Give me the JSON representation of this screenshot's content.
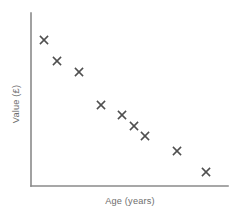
{
  "figure": {
    "width": 241,
    "height": 215,
    "background": "#ffffff"
  },
  "chart_data": {
    "type": "scatter",
    "title": "",
    "subtitle": "",
    "xlabel": "Age (years)",
    "ylabel": "Value (£)",
    "grid": false,
    "legend": null,
    "legend_position": "none",
    "xticks": [],
    "yticks": [],
    "xticklabels": [],
    "yticklabels": [],
    "xlim": [
      0,
      10
    ],
    "ylim": [
      0,
      10
    ],
    "marker": "x",
    "marker_color": "#4f4f4f",
    "axis_color": "#8a8a8a",
    "n_points": 9,
    "annotations": [],
    "points": [
      {
        "x": 1.0,
        "y": 9.0
      },
      {
        "x": 1.7,
        "y": 7.8
      },
      {
        "x": 2.8,
        "y": 7.2
      },
      {
        "x": 4.0,
        "y": 5.3
      },
      {
        "x": 5.0,
        "y": 4.7
      },
      {
        "x": 5.6,
        "y": 4.1
      },
      {
        "x": 6.2,
        "y": 3.5
      },
      {
        "x": 8.0,
        "y": 2.7
      },
      {
        "x": 9.5,
        "y": 1.5
      }
    ],
    "pixel_points": [
      {
        "cx": 44,
        "cy": 40
      },
      {
        "cx": 57,
        "cy": 61
      },
      {
        "cx": 79,
        "cy": 72
      },
      {
        "cx": 101,
        "cy": 105
      },
      {
        "cx": 122,
        "cy": 115
      },
      {
        "cx": 134,
        "cy": 126
      },
      {
        "cx": 145,
        "cy": 136
      },
      {
        "cx": 177,
        "cy": 151
      },
      {
        "cx": 206,
        "cy": 172
      }
    ],
    "axes_geometry": {
      "origin_x": 31,
      "origin_y": 186,
      "y_axis_top": 13,
      "x_axis_right": 228
    },
    "label_positions": {
      "xlabel_x": 130,
      "xlabel_y": 204,
      "ylabel_x": 19,
      "ylabel_y": 104
    }
  }
}
